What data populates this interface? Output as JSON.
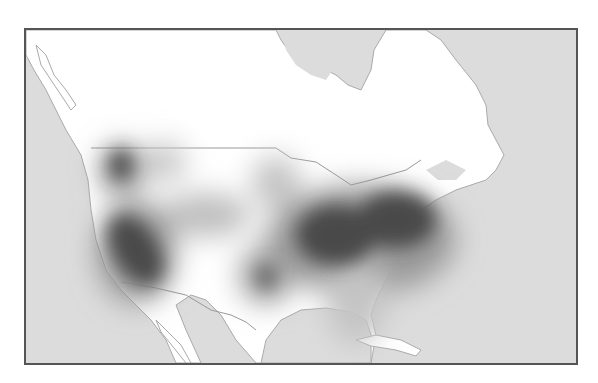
{
  "map": {
    "title": "",
    "region": "North America",
    "type": "heatmap",
    "colors": {
      "ocean": "#d9d9d9",
      "land": "#ffffff",
      "border": "#9a9a9a",
      "frame": "#555555",
      "hot": "#4a4a4a"
    },
    "hotspots": [
      {
        "name": "pacific-northwest",
        "cx": 95,
        "cy": 135,
        "rx": 14,
        "ry": 18,
        "intensity": 0.85
      },
      {
        "name": "california",
        "cx": 105,
        "cy": 220,
        "rx": 30,
        "ry": 45,
        "intensity": 1.0
      },
      {
        "name": "northeast-midwest",
        "cx": 335,
        "cy": 200,
        "rx": 85,
        "ry": 42,
        "intensity": 1.0
      },
      {
        "name": "texas",
        "cx": 240,
        "cy": 245,
        "rx": 18,
        "ry": 22,
        "intensity": 0.75
      },
      {
        "name": "mountain-west",
        "cx": 180,
        "cy": 185,
        "rx": 40,
        "ry": 22,
        "intensity": 0.35
      },
      {
        "name": "idaho-montana",
        "cx": 135,
        "cy": 130,
        "rx": 18,
        "ry": 18,
        "intensity": 0.25
      },
      {
        "name": "upper-midwest",
        "cx": 250,
        "cy": 150,
        "rx": 22,
        "ry": 25,
        "intensity": 0.3
      },
      {
        "name": "southeast",
        "cx": 330,
        "cy": 270,
        "rx": 30,
        "ry": 40,
        "intensity": 0.3
      }
    ]
  }
}
